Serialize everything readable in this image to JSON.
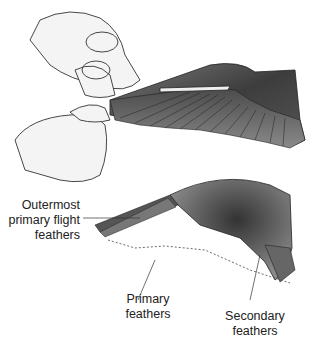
{
  "figure": {
    "labels": {
      "outermost": [
        "Outermost",
        "primary flight",
        "feathers"
      ],
      "primary": [
        "Primary",
        "feathers"
      ],
      "secondary": [
        "Secondary",
        "feathers"
      ]
    },
    "colors": {
      "feather_dark": "#3a3a3a",
      "feather_mid": "#6b6b6b",
      "skin": "#f2f2f2",
      "line": "#333333"
    }
  }
}
